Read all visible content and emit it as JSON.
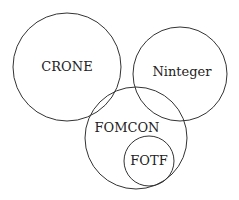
{
  "diagram": {
    "type": "venn",
    "sets": [
      {
        "id": "crone",
        "label": "CRONE",
        "cx": 67,
        "cy": 67,
        "r": 54,
        "lx": 67,
        "ly": 71
      },
      {
        "id": "ninteger",
        "label": "Ninteger",
        "cx": 180,
        "cy": 74,
        "r": 47,
        "lx": 182,
        "ly": 76
      },
      {
        "id": "fomcon",
        "label": "FOMCON",
        "cx": 136,
        "cy": 138,
        "r": 51,
        "lx": 127,
        "ly": 132
      },
      {
        "id": "fotf",
        "label": "FOTF",
        "cx": 149,
        "cy": 161,
        "r": 25,
        "lx": 149,
        "ly": 165
      }
    ],
    "stroke_color": "#333333",
    "background": "#ffffff"
  }
}
